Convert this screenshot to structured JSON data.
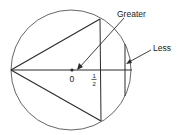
{
  "diagram": {
    "labels": {
      "greater": "Greater",
      "less": "Less",
      "center": "0",
      "half_num": "1",
      "half_den": "2"
    },
    "colors": {
      "stroke": "#2a2a2a",
      "text": "#222222",
      "background": "#ffffff"
    }
  }
}
